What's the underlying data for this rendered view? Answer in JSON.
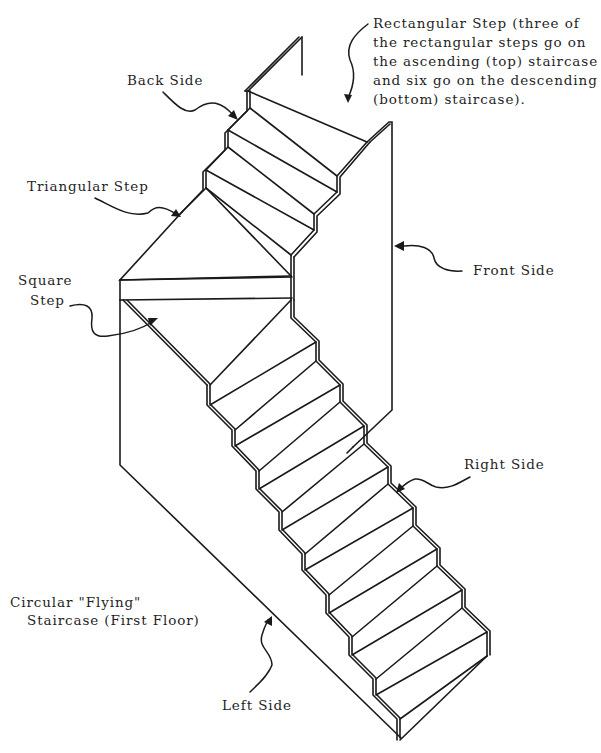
{
  "diagram": {
    "title_lines": [
      "Circular \"Flying\"",
      "Staircase (First Floor)"
    ],
    "labels": {
      "rectangular_step": {
        "lines": [
          "Rectangular Step  (three of",
          "the rectangular steps go on",
          "the ascending (top) staircase",
          "and six go on the descending",
          "(bottom) staircase)."
        ]
      },
      "back_side": "Back Side",
      "triangular_step": "Triangular Step",
      "square_step": [
        "Square",
        "Step"
      ],
      "front_side": "Front Side",
      "right_side": "Right Side",
      "left_side": "Left Side"
    },
    "components": {
      "ascending_rectangular_steps": 3,
      "descending_rectangular_steps": 6,
      "triangular_steps": 1,
      "square_steps": 1,
      "side_panels": [
        "Back Side",
        "Front Side",
        "Right Side",
        "Left Side"
      ]
    },
    "colors": {
      "line": "#1a1a1a",
      "text": "#1f1f1f",
      "background": "#ffffff"
    }
  }
}
